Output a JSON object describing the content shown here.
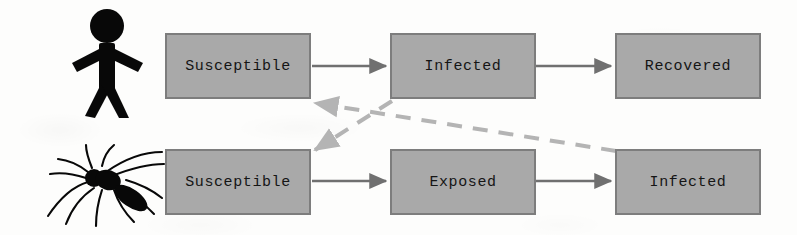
{
  "diagram": {
    "colors": {
      "background": "#fdfdfc",
      "node_fill": "#a9a9a9",
      "node_border": "#7d7d7d",
      "node_text": "#151515",
      "solid_arrow": "#707070",
      "dashed_arrow": "#b4b4b4",
      "icon": "#000000"
    },
    "rows": [
      {
        "id": "human-row",
        "actor": "stick-figure-person",
        "nodes": [
          {
            "id": "human-susceptible",
            "label": "Susceptible"
          },
          {
            "id": "human-infected",
            "label": "Infected"
          },
          {
            "id": "human-recovered",
            "label": "Recovered"
          }
        ]
      },
      {
        "id": "mosquito-row",
        "actor": "mosquito",
        "nodes": [
          {
            "id": "mosquito-susceptible",
            "label": "Susceptible"
          },
          {
            "id": "mosquito-exposed",
            "label": "Exposed"
          },
          {
            "id": "mosquito-infected",
            "label": "Infected"
          }
        ]
      }
    ],
    "edges": [
      {
        "id": "edge-human-s-to-i",
        "from": "human-susceptible",
        "to": "human-infected",
        "style": "solid"
      },
      {
        "id": "edge-human-i-to-r",
        "from": "human-infected",
        "to": "human-recovered",
        "style": "solid"
      },
      {
        "id": "edge-mosquito-s-to-e",
        "from": "mosquito-susceptible",
        "to": "mosquito-exposed",
        "style": "solid"
      },
      {
        "id": "edge-mosquito-e-to-i",
        "from": "mosquito-exposed",
        "to": "mosquito-infected",
        "style": "solid"
      },
      {
        "id": "edge-human-i-to-mosquito-s",
        "from": "human-infected",
        "to": "mosquito-susceptible",
        "style": "dashed"
      },
      {
        "id": "edge-mosquito-i-to-human-s",
        "from": "mosquito-infected",
        "to": "human-susceptible",
        "style": "dashed"
      }
    ]
  }
}
